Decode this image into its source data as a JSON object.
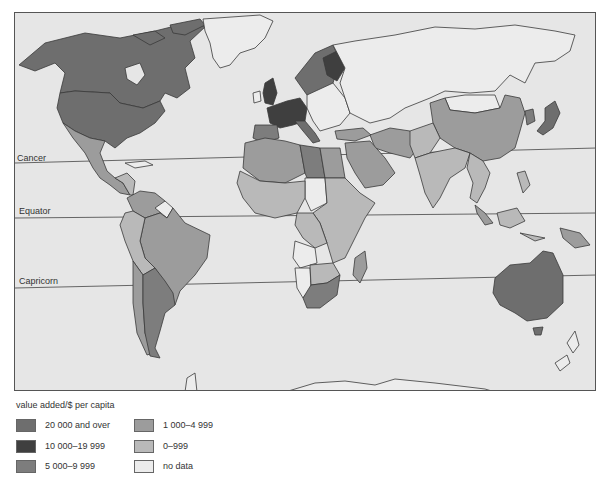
{
  "map": {
    "title": "value added/$ per capita",
    "lines": {
      "cancer": "Cancer",
      "equator": "Equator",
      "capricorn": "Capricorn"
    },
    "colors": {
      "ocean": "#e6e6e6",
      "border": "#3a3a3a",
      "c20000": "#6e6e6e",
      "c10000": "#3f3f3f",
      "c5000": "#7d7d7d",
      "c1000": "#9c9c9c",
      "c0": "#b9b9b9",
      "nodata": "#ececec"
    }
  },
  "legend": {
    "title": "value added/$ per capita",
    "items": [
      {
        "label": "20 000 and over",
        "color": "#6e6e6e"
      },
      {
        "label": "10 000–19 999",
        "color": "#3f3f3f"
      },
      {
        "label": "5 000–9 999",
        "color": "#7d7d7d"
      },
      {
        "label": "1 000–4 999",
        "color": "#9c9c9c"
      },
      {
        "label": "0–999",
        "color": "#b9b9b9"
      },
      {
        "label": "no data",
        "color": "#ececec"
      }
    ]
  },
  "regions": {
    "20000_and_over": [
      "USA",
      "Canada",
      "Japan",
      "Australia",
      "Sweden",
      "Norway (part)"
    ],
    "10000_19999": [
      "United Kingdom",
      "France",
      "Germany",
      "Finland",
      "Italy (part)"
    ],
    "5000_9999": [
      "Spain",
      "Argentina",
      "Libya",
      "South Africa",
      "Korea"
    ],
    "1000_4999": [
      "Mexico",
      "Brazil",
      "Venezuela",
      "Chile",
      "Algeria",
      "Saudi Arabia",
      "Iran",
      "Egypt",
      "Malaysia"
    ],
    "0_999": [
      "China",
      "India",
      "most of Africa",
      "Southeast Asia",
      "Peru",
      "Bolivia",
      "Colombia"
    ],
    "no_data": [
      "Greenland",
      "USSR",
      "Eastern Europe",
      "Mongolia",
      "Chad",
      "Angola",
      "Namibia",
      "New Zealand",
      "Antarctica"
    ]
  }
}
